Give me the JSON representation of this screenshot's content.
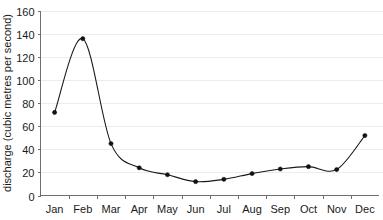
{
  "chart_data": {
    "type": "line",
    "title": "",
    "xlabel": "",
    "ylabel": "discharge (cubic metres per second)",
    "categories": [
      "Jan",
      "Feb",
      "Mar",
      "Apr",
      "May",
      "Jun",
      "Jul",
      "Aug",
      "Sep",
      "Oct",
      "Nov",
      "Dec"
    ],
    "values": [
      72,
      136,
      45,
      24,
      18,
      12,
      14,
      19,
      23,
      25,
      22.5,
      52
    ],
    "series": [
      {
        "name": "discharge",
        "values": [
          72,
          136,
          45,
          24,
          18,
          12,
          14,
          19,
          23,
          25,
          22.5,
          52
        ]
      }
    ],
    "ylim": [
      0,
      160
    ],
    "yticks": [
      0,
      20,
      40,
      60,
      80,
      100,
      120,
      140,
      160
    ],
    "ytick_labels": [
      "0",
      "20",
      "40",
      "60",
      "80",
      "100",
      "120",
      "140",
      "160"
    ],
    "grid": true,
    "grid_axis": "y",
    "legend": false,
    "legend_position": "none",
    "marker": "filled-circle",
    "line_style": "smooth",
    "colors": {
      "line": "#1a1a1a",
      "marker": "#111111",
      "grid": "#ececed",
      "axis": "#6f6f70",
      "text": "#1a1a1a",
      "background": "#ffffff"
    }
  }
}
